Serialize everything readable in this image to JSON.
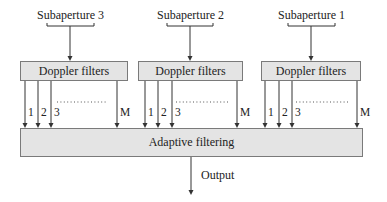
{
  "diagram": {
    "subapertures": [
      {
        "label": "Subaperture 3",
        "x": 70
      },
      {
        "label": "Subaperture 2",
        "x": 190
      },
      {
        "label": "Subaperture 1",
        "x": 311
      }
    ],
    "doppler_boxes": [
      {
        "label": "Doppler filters",
        "left": 20,
        "right": 128
      },
      {
        "label": "Doppler filters",
        "left": 138,
        "right": 243
      },
      {
        "label": "Doppler filters",
        "left": 261,
        "right": 361
      }
    ],
    "channel_labels": [
      "1",
      "2",
      "3",
      "M"
    ],
    "ellipsis": "...............",
    "adaptive_box": {
      "label": "Adaptive filtering"
    },
    "output": {
      "label": "Output"
    },
    "colors": {
      "box_fill": "#e4e4e4",
      "box_border": "#7a7a7a",
      "line": "#333333"
    }
  }
}
